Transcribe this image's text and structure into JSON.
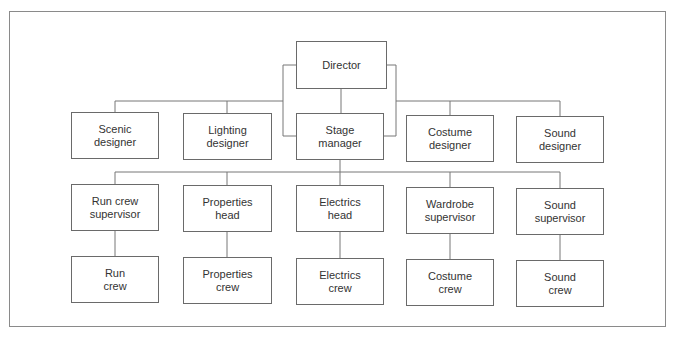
{
  "diagram": {
    "type": "org-chart",
    "root": {
      "id": "director",
      "lines": [
        "Director"
      ]
    },
    "row1": [
      {
        "id": "scenic-designer",
        "lines": [
          "Scenic",
          "designer"
        ]
      },
      {
        "id": "lighting-designer",
        "lines": [
          "Lighting",
          "designer"
        ]
      },
      {
        "id": "stage-manager",
        "lines": [
          "Stage",
          "manager"
        ]
      },
      {
        "id": "costume-designer",
        "lines": [
          "Costume",
          "designer"
        ]
      },
      {
        "id": "sound-designer",
        "lines": [
          "Sound",
          "designer"
        ]
      }
    ],
    "row2": [
      {
        "id": "run-crew-supervisor",
        "lines": [
          "Run crew",
          "supervisor"
        ]
      },
      {
        "id": "properties-head",
        "lines": [
          "Properties",
          "head"
        ]
      },
      {
        "id": "electrics-head",
        "lines": [
          "Electrics",
          "head"
        ]
      },
      {
        "id": "wardrobe-supervisor",
        "lines": [
          "Wardrobe",
          "supervisor"
        ]
      },
      {
        "id": "sound-supervisor",
        "lines": [
          "Sound",
          "supervisor"
        ]
      }
    ],
    "row3": [
      {
        "id": "run-crew",
        "lines": [
          "Run",
          "crew"
        ]
      },
      {
        "id": "properties-crew",
        "lines": [
          "Properties",
          "crew"
        ]
      },
      {
        "id": "electrics-crew",
        "lines": [
          "Electrics",
          "crew"
        ]
      },
      {
        "id": "costume-crew",
        "lines": [
          "Costume",
          "crew"
        ]
      },
      {
        "id": "sound-crew",
        "lines": [
          "Sound",
          "crew"
        ]
      }
    ],
    "edges": [
      [
        "director",
        "scenic-designer"
      ],
      [
        "director",
        "lighting-designer"
      ],
      [
        "director",
        "stage-manager"
      ],
      [
        "director",
        "costume-designer"
      ],
      [
        "director",
        "sound-designer"
      ],
      [
        "stage-manager",
        "run-crew-supervisor"
      ],
      [
        "stage-manager",
        "properties-head"
      ],
      [
        "stage-manager",
        "electrics-head"
      ],
      [
        "stage-manager",
        "wardrobe-supervisor"
      ],
      [
        "stage-manager",
        "sound-supervisor"
      ],
      [
        "run-crew-supervisor",
        "run-crew"
      ],
      [
        "properties-head",
        "properties-crew"
      ],
      [
        "electrics-head",
        "electrics-crew"
      ],
      [
        "wardrobe-supervisor",
        "costume-crew"
      ],
      [
        "sound-supervisor",
        "sound-crew"
      ]
    ]
  }
}
